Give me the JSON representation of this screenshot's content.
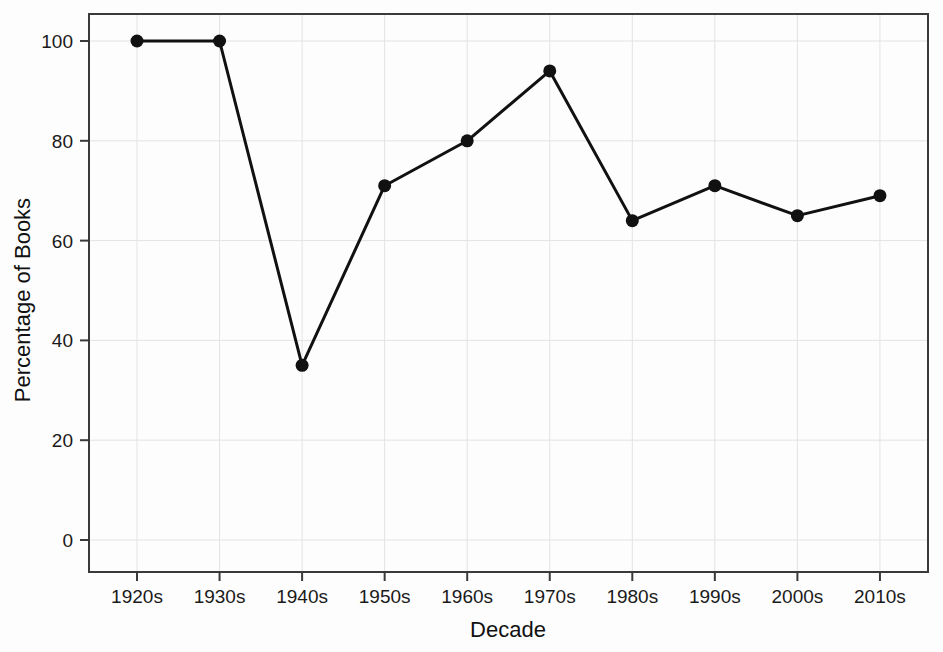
{
  "chart_data": {
    "type": "line",
    "title": "",
    "xlabel": "Decade",
    "ylabel": "Percentage of Books",
    "categories": [
      "1920s",
      "1930s",
      "1940s",
      "1950s",
      "1960s",
      "1970s",
      "1980s",
      "1990s",
      "2000s",
      "2010s"
    ],
    "values": [
      100,
      100,
      35,
      71,
      80,
      94,
      64,
      71,
      65,
      69
    ],
    "series": [
      {
        "name": "Percentage of Books",
        "values": [
          100,
          100,
          35,
          71,
          80,
          94,
          64,
          71,
          65,
          69
        ]
      }
    ],
    "ylim": [
      0,
      105
    ],
    "yticks": [
      0,
      20,
      40,
      60,
      80,
      100
    ],
    "ytick_labels": [
      "0",
      "20",
      "40",
      "60",
      "80",
      "100"
    ],
    "xtick_labels": [
      "1920s",
      "1930s",
      "1940s",
      "1950s",
      "1960s",
      "1970s",
      "1980s",
      "1990s",
      "2000s",
      "2010s"
    ],
    "grid": true,
    "legend": "none",
    "line_color": "#111111",
    "marker_color": "#111111",
    "marker": "circle",
    "grid_color": "#e3e3e3",
    "frame_color": "#3a3a3a",
    "background_color": "#fdfdfd"
  }
}
